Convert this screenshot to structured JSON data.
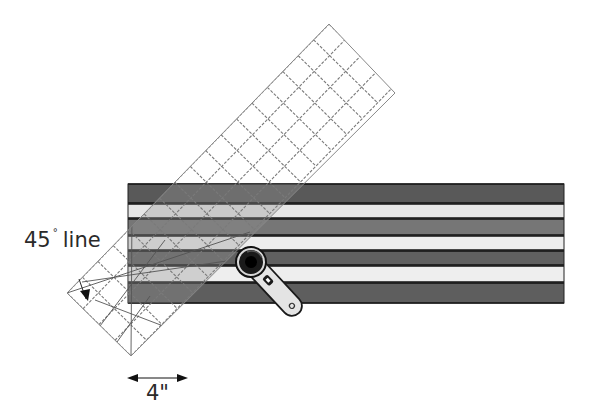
{
  "diagram": {
    "labels": {
      "angle_value": "45",
      "angle_degree_symbol": "°",
      "angle_suffix": "line",
      "width": "4\""
    },
    "fabric_strip_set": {
      "x": 128,
      "width": 436,
      "strips": [
        {
          "y": 184,
          "h": 19,
          "color": "#595959"
        },
        {
          "y": 204,
          "h": 14,
          "color": "#e6e6e6"
        },
        {
          "y": 219,
          "h": 16,
          "color": "#767676"
        },
        {
          "y": 236,
          "h": 14,
          "color": "#ededed"
        },
        {
          "y": 251,
          "h": 14,
          "color": "#606060"
        },
        {
          "y": 266,
          "h": 16,
          "color": "#eeeeee"
        },
        {
          "y": 283,
          "h": 20,
          "color": "#5e5e5e"
        }
      ],
      "seam_color": "#111111"
    },
    "ruler": {
      "corners": {
        "left": [
          67,
          293
        ],
        "bottom": [
          131,
          356
        ],
        "right": [
          395,
          93
        ],
        "top": [
          329,
          24
        ]
      },
      "grid_color": "#7a7a7a",
      "overlay_tint": "rgba(150,150,150,0.35)"
    },
    "rotary_cutter": {
      "blade_center": [
        251,
        262
      ],
      "handle_end": [
        303,
        308
      ]
    },
    "colors": {
      "background": "#ffffff",
      "text": "#2a2a2a",
      "arrow": "#111111"
    }
  }
}
